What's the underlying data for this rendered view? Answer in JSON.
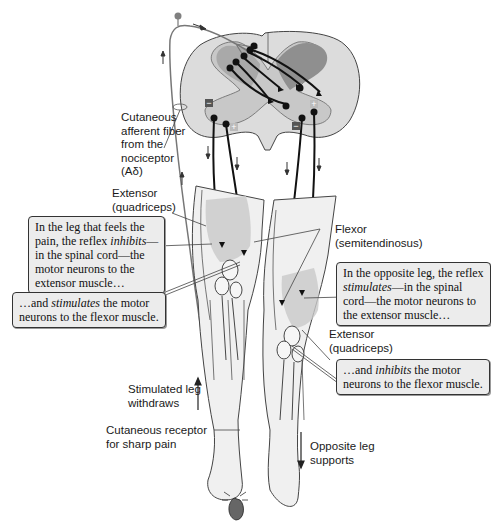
{
  "figure": {
    "labels": {
      "afferent_fiber": [
        "Cutaneous",
        "afferent fiber",
        "from the",
        "nociceptor",
        "(Aδ)"
      ],
      "extensor_left": [
        "Extensor",
        "(quadriceps)"
      ],
      "flexor": [
        "Flexor",
        "(semitendinosus)"
      ],
      "extensor_right": [
        "Extensor",
        "(quadriceps)"
      ],
      "stimulated_leg": [
        "Stimulated leg",
        "withdraws"
      ],
      "cutaneous_receptor": [
        "Cutaneous receptor",
        "for sharp pain"
      ],
      "opposite_leg": [
        "Opposite leg",
        "supports"
      ]
    },
    "callouts": {
      "left_inhibits": {
        "line1": "In the leg that feels the",
        "line2_pre": "pain, the reflex ",
        "line2_em": "inhibits",
        "line2_post": "—",
        "line3": "in the spinal cord—the",
        "line4": "motor neurons to the",
        "line5": "extensor muscle…"
      },
      "left_stimulates": {
        "line1_pre": "…and ",
        "line1_em": "stimulates",
        "line1_post": " the motor",
        "line2": "neurons to the flexor muscle."
      },
      "right_stimulates": {
        "line1": "In the opposite leg, the reflex",
        "line2_em": "stimulates",
        "line2_post": "—in the spinal",
        "line3": "cord—the motor neurons to",
        "line4": "the extensor muscle…"
      },
      "right_inhibits": {
        "line1_pre": "…and ",
        "line1_em": "inhibits",
        "line1_post": " the motor",
        "line2": "neurons to the flexor muscle."
      }
    },
    "synapse_signs": {
      "inhibitory": "−",
      "excitatory": "+"
    },
    "colors": {
      "gray_matter": "#9a9a9a",
      "white_matter": "#dcdcdc",
      "neuron": "#111111",
      "afferent": "#7a7a7a",
      "callout_bg": "#ececec"
    }
  }
}
